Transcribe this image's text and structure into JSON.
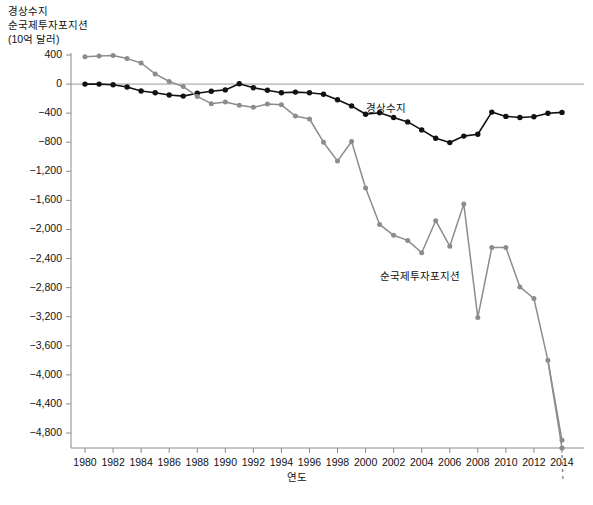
{
  "chart_data": {
    "type": "line",
    "title": "경상수지\n순국제투자포지션\n(10억 달러)",
    "ylabel": "경상수지\n순국제투자포지션\n(10억 달러)",
    "xlabel": "연도",
    "x": [
      1980,
      1981,
      1982,
      1983,
      1984,
      1985,
      1986,
      1987,
      1988,
      1989,
      1990,
      1991,
      1992,
      1993,
      1994,
      1995,
      1996,
      1997,
      1998,
      1999,
      2000,
      2001,
      2002,
      2003,
      2004,
      2005,
      2006,
      2007,
      2008,
      2009,
      2010,
      2011,
      2012,
      2013,
      2014
    ],
    "xlim": [
      1979,
      2015
    ],
    "ylim": [
      -4800,
      400
    ],
    "yticks": [
      400,
      0,
      -400,
      -800,
      -1200,
      -1600,
      -2000,
      -2400,
      -2800,
      -3200,
      -3600,
      -4000,
      -4400,
      -4800
    ],
    "ytick_labels": [
      "400",
      "0",
      "−400",
      "−800",
      "−1,200",
      "−1,600",
      "−2,000",
      "−2,400",
      "−2,800",
      "−3,200",
      "−3,600",
      "−4,000",
      "−4,400",
      "−4,800"
    ],
    "xticks": [
      1980,
      1982,
      1984,
      1986,
      1988,
      1990,
      1992,
      1994,
      1996,
      1998,
      2000,
      2002,
      2004,
      2006,
      2008,
      2010,
      2012,
      2014
    ],
    "xtick_labels": [
      "1980",
      "1982",
      "1984",
      "1986",
      "1988",
      "1990",
      "1992",
      "1994",
      "1996",
      "1998",
      "2000",
      "2002",
      "2004",
      "2006",
      "2008",
      "2010",
      "2012",
      "2014"
    ],
    "grid": false,
    "legend_position": "inline-annotations",
    "zero_line": true,
    "series": [
      {
        "name": "경상수지",
        "color": "#111111",
        "marker": "circle",
        "label_x": 2002,
        "label_y": -330,
        "values": [
          0,
          0,
          -10,
          -40,
          -95,
          -120,
          -150,
          -165,
          -125,
          -100,
          -80,
          5,
          -50,
          -85,
          -120,
          -110,
          -120,
          -140,
          -215,
          -300,
          -415,
          -395,
          -460,
          -520,
          -630,
          -745,
          -805,
          -715,
          -690,
          -385,
          -445,
          -460,
          -450,
          -400,
          -390
        ]
      },
      {
        "name": "순국제투자포지션",
        "color": "#8c8c8c",
        "marker": "circle",
        "label_x": 2003,
        "label_y": -2640,
        "dashed_tail": true,
        "values": [
          375,
          385,
          395,
          350,
          290,
          140,
          35,
          -35,
          -170,
          -270,
          -245,
          -290,
          -320,
          -275,
          -285,
          -440,
          -480,
          -800,
          -1060,
          -790,
          -1430,
          -1930,
          -2080,
          -2150,
          -2320,
          -1880,
          -2230,
          -1650,
          -3210,
          -2250,
          -2250,
          -2790,
          -2950,
          -3800,
          -4900
        ]
      }
    ]
  },
  "axes": {
    "y_axis_name": "net-international-investment-position-axis",
    "x_axis_name": "year-axis"
  }
}
